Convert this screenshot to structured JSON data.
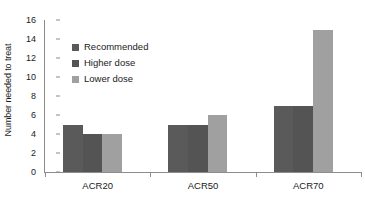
{
  "chart_data": {
    "type": "bar",
    "title": "",
    "subtitle": "",
    "xlabel": "",
    "ylabel": "Number needed to treat",
    "categories": [
      "ACR20",
      "ACR50",
      "ACR70"
    ],
    "series": [
      {
        "name": "Recommended",
        "values": [
          5,
          5,
          7
        ],
        "color": "#5a5a5a"
      },
      {
        "name": "Higher dose",
        "values": [
          4,
          5,
          7
        ],
        "color": "#545454"
      },
      {
        "name": "Lower dose",
        "values": [
          4,
          6,
          15
        ],
        "color": "#a0a0a0"
      }
    ],
    "ylim": [
      0,
      16
    ],
    "yticks": [
      0,
      2,
      4,
      6,
      8,
      10,
      12,
      14,
      16
    ],
    "ytick_labels": [
      "0",
      "2",
      "4",
      "6",
      "8",
      "10",
      "12",
      "14",
      "16"
    ],
    "grid": false,
    "legend_position": "inside-upper-left",
    "bar_gap_within_group": 0,
    "axis_color": "#8c8c8c",
    "text_color": "#1a1a1a",
    "background": "#ffffff"
  }
}
